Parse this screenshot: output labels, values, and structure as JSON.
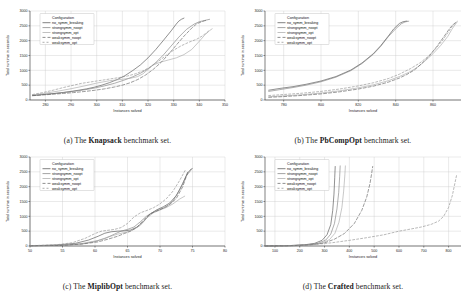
{
  "figure": {
    "background": "#ffffff",
    "axis_label_y": "Total runtime in seconds",
    "axis_label_x": "Instances solved",
    "legend_title": "Configuration",
    "series_names": [
      "no_symm_breaking",
      "strongsymm_noopt",
      "strongsymm_opt",
      "weaksymm_noopt",
      "weaksymm_opt"
    ],
    "series_colors": [
      "#4c4c4c",
      "#7d7d7d",
      "#a6a6a6",
      "#5f5f5f",
      "#8d8d8d"
    ],
    "series_dash": [
      "none",
      "none",
      "none",
      "3 2",
      "2 2"
    ]
  },
  "panels": [
    {
      "key": "a",
      "caption_prefix": "(a) The ",
      "caption_bold": "Knapsack",
      "caption_suffix": " benchmark set."
    },
    {
      "key": "b",
      "caption_prefix": "(b) The ",
      "caption_bold": "PbCompOpt",
      "caption_suffix": " benchmark set."
    },
    {
      "key": "c",
      "caption_prefix": "(c) The ",
      "caption_bold": "MiplibOpt",
      "caption_suffix": " benchmark set."
    },
    {
      "key": "d",
      "caption_prefix": "(d) The ",
      "caption_bold": "Crafted",
      "caption_suffix": " benchmark set."
    }
  ],
  "chart_data": [
    {
      "type": "line",
      "panel": "a",
      "title": "The Knapsack benchmark set.",
      "xlabel": "Instances solved",
      "ylabel": "Total runtime in seconds",
      "xlim": [
        274,
        350
      ],
      "ylim": [
        0,
        3000
      ],
      "xticks": [
        280,
        290,
        300,
        310,
        320,
        330,
        340,
        350
      ],
      "yticks": [
        0,
        500,
        1000,
        1500,
        2000,
        2500,
        3000
      ],
      "grid": true,
      "legend_position": "upper left",
      "series": [
        {
          "name": "no_symm_breaking",
          "x": [
            275,
            278,
            281,
            284,
            287,
            290,
            293,
            296,
            299,
            302,
            305,
            308,
            311,
            314,
            317,
            320,
            323,
            326,
            329,
            331,
            332,
            333,
            334
          ],
          "values": [
            150,
            175,
            200,
            225,
            255,
            290,
            330,
            375,
            430,
            500,
            585,
            690,
            820,
            990,
            1180,
            1420,
            1700,
            2010,
            2330,
            2560,
            2660,
            2720,
            2760
          ]
        },
        {
          "name": "strongsymm_noopt",
          "x": [
            275,
            279,
            283,
            287,
            291,
            295,
            299,
            303,
            307,
            311,
            314,
            317,
            320,
            323,
            326,
            329,
            332,
            335,
            338,
            340,
            342,
            343,
            344
          ],
          "values": [
            155,
            185,
            215,
            250,
            290,
            340,
            400,
            475,
            565,
            680,
            780,
            900,
            1050,
            1260,
            1520,
            1820,
            2120,
            2380,
            2560,
            2640,
            2680,
            2700,
            2720
          ]
        },
        {
          "name": "strongsymm_opt",
          "x": [
            275,
            280,
            285,
            290,
            295,
            300,
            305,
            310,
            313,
            316,
            318,
            320,
            322,
            325,
            328,
            331,
            334,
            337,
            340,
            342,
            344,
            345
          ],
          "values": [
            170,
            230,
            300,
            380,
            470,
            570,
            650,
            700,
            730,
            790,
            880,
            1030,
            1180,
            1280,
            1350,
            1420,
            1530,
            1700,
            1980,
            2180,
            2340,
            2400
          ]
        },
        {
          "name": "weaksymm_noopt",
          "x": [
            275,
            279,
            283,
            287,
            291,
            295,
            299,
            303,
            307,
            310,
            313,
            316,
            319,
            322,
            325,
            328,
            331,
            334,
            337,
            339,
            341,
            342,
            343
          ],
          "values": [
            145,
            170,
            195,
            220,
            250,
            285,
            325,
            375,
            440,
            500,
            580,
            690,
            840,
            1030,
            1260,
            1540,
            1850,
            2150,
            2420,
            2570,
            2640,
            2670,
            2690
          ]
        },
        {
          "name": "weaksymm_opt",
          "x": [
            275,
            279,
            283,
            287,
            291,
            294,
            297,
            300,
            303,
            306,
            309,
            312,
            315,
            318,
            321,
            324,
            327,
            330,
            333,
            336,
            339,
            341,
            343,
            344
          ],
          "values": [
            185,
            250,
            330,
            420,
            500,
            560,
            600,
            640,
            680,
            720,
            760,
            810,
            880,
            980,
            1120,
            1300,
            1500,
            1680,
            1830,
            1950,
            2050,
            2150,
            2280,
            2360
          ]
        }
      ]
    },
    {
      "type": "line",
      "panel": "b",
      "title": "The PbCompOpt benchmark set.",
      "xlabel": "Instances solved",
      "ylabel": "Total runtime in seconds",
      "xlim": [
        770,
        875
      ],
      "ylim": [
        0,
        3000
      ],
      "xticks": [
        780,
        800,
        820,
        840,
        860
      ],
      "yticks": [
        0,
        500,
        1000,
        1500,
        2000,
        2500,
        3000
      ],
      "grid": true,
      "legend_position": "upper left",
      "series": [
        {
          "name": "no_symm_breaking",
          "x": [
            772,
            778,
            785,
            792,
            800,
            808,
            816,
            822,
            828,
            832,
            836,
            839,
            842,
            844,
            845,
            846
          ],
          "values": [
            330,
            390,
            450,
            530,
            640,
            790,
            1010,
            1250,
            1560,
            1830,
            2150,
            2400,
            2580,
            2640,
            2650,
            2660
          ]
        },
        {
          "name": "strongsymm_noopt",
          "x": [
            772,
            778,
            785,
            792,
            800,
            808,
            816,
            822,
            828,
            832,
            836,
            840,
            843,
            845,
            846,
            847
          ],
          "values": [
            290,
            350,
            420,
            500,
            615,
            770,
            990,
            1230,
            1540,
            1810,
            2130,
            2400,
            2570,
            2630,
            2645,
            2655
          ]
        },
        {
          "name": "strongsymm_opt",
          "x": [
            772,
            780,
            790,
            800,
            810,
            820,
            828,
            836,
            842,
            848,
            852,
            856,
            860,
            864,
            868,
            870,
            872,
            873
          ],
          "values": [
            110,
            140,
            180,
            235,
            310,
            410,
            510,
            650,
            790,
            960,
            1120,
            1330,
            1560,
            1830,
            2150,
            2370,
            2560,
            2620
          ]
        },
        {
          "name": "weaksymm_noopt",
          "x": [
            772,
            780,
            790,
            800,
            810,
            820,
            828,
            836,
            842,
            846,
            850,
            854,
            858,
            862,
            866,
            869,
            871,
            873
          ],
          "values": [
            90,
            115,
            155,
            205,
            275,
            370,
            465,
            600,
            740,
            860,
            1010,
            1230,
            1480,
            1800,
            2150,
            2420,
            2560,
            2640
          ]
        },
        {
          "name": "weaksymm_opt",
          "x": [
            772,
            780,
            790,
            800,
            810,
            820,
            828,
            836,
            842,
            848,
            853,
            857,
            861,
            865,
            868,
            870,
            872,
            873
          ],
          "values": [
            150,
            185,
            230,
            290,
            370,
            475,
            580,
            720,
            870,
            1060,
            1250,
            1450,
            1700,
            2000,
            2270,
            2460,
            2600,
            2650
          ]
        }
      ]
    },
    {
      "type": "line",
      "panel": "c",
      "title": "The MiplibOpt benchmark set.",
      "xlabel": "Instances solved",
      "ylabel": "Total runtime in seconds",
      "xlim": [
        50,
        80
      ],
      "ylim": [
        0,
        3000
      ],
      "xticks": [
        50,
        55,
        60,
        65,
        70,
        75,
        80
      ],
      "yticks": [
        0,
        500,
        1000,
        1500,
        2000,
        2500,
        3000
      ],
      "grid": true,
      "legend_position": "upper left",
      "series": [
        {
          "name": "no_symm_breaking",
          "x": [
            50,
            54,
            57,
            59,
            60.5,
            61.5,
            62.5,
            63.5,
            64.5,
            65.5,
            66.5,
            67.5,
            68.5,
            69.5,
            70.5,
            71.5,
            72.5,
            73.5,
            74.2,
            74.8
          ],
          "values": [
            10,
            30,
            90,
            200,
            330,
            430,
            480,
            500,
            510,
            540,
            640,
            830,
            1080,
            1220,
            1320,
            1450,
            1700,
            2100,
            2450,
            2600
          ]
        },
        {
          "name": "strongsymm_noopt",
          "x": [
            50,
            55,
            58,
            60,
            61.5,
            63,
            64,
            65,
            66,
            67,
            68,
            69,
            70,
            71,
            72,
            73,
            74,
            75
          ],
          "values": [
            8,
            25,
            70,
            150,
            250,
            400,
            500,
            560,
            640,
            820,
            1020,
            1150,
            1230,
            1320,
            1520,
            1880,
            2350,
            2620
          ]
        },
        {
          "name": "strongsymm_opt",
          "x": [
            50,
            55,
            58,
            60.5,
            62,
            63.5,
            65,
            66,
            67,
            68,
            69,
            70,
            71,
            72,
            73,
            73.8
          ],
          "values": [
            10,
            30,
            85,
            190,
            300,
            400,
            480,
            560,
            700,
            950,
            1120,
            1210,
            1300,
            1420,
            1580,
            1680
          ]
        },
        {
          "name": "weaksymm_noopt",
          "x": [
            50,
            55,
            58,
            60.5,
            62,
            63.5,
            64.5,
            65.5,
            66.5,
            67.5,
            68.5,
            69.5,
            70.5,
            71.5,
            72.5,
            73.5,
            74.3
          ],
          "values": [
            8,
            22,
            65,
            140,
            230,
            330,
            420,
            500,
            640,
            880,
            1080,
            1180,
            1280,
            1400,
            1600,
            2000,
            2500
          ]
        },
        {
          "name": "weaksymm_opt",
          "x": [
            50,
            54,
            56.5,
            58.5,
            60,
            61,
            62,
            63,
            64,
            65,
            66,
            67,
            68,
            69,
            70,
            71,
            72,
            73,
            74
          ],
          "values": [
            12,
            40,
            110,
            260,
            420,
            500,
            530,
            560,
            620,
            760,
            980,
            1120,
            1200,
            1290,
            1420,
            1600,
            1850,
            2200,
            2600
          ]
        }
      ]
    },
    {
      "type": "line",
      "panel": "d",
      "title": "The Crafted benchmark set.",
      "xlabel": "Instances solved",
      "ylabel": "Total runtime in seconds",
      "xlim": [
        60,
        850
      ],
      "ylim": [
        0,
        3000
      ],
      "xticks": [
        100,
        200,
        300,
        400,
        500,
        600,
        700,
        800
      ],
      "yticks": [
        0,
        500,
        1000,
        1500,
        2000,
        2500,
        3000
      ],
      "grid": true,
      "legend_position": "upper left",
      "series": [
        {
          "name": "no_symm_breaking",
          "x": [
            60,
            150,
            220,
            260,
            290,
            310,
            325,
            333,
            338,
            341,
            343
          ],
          "values": [
            2,
            10,
            40,
            90,
            190,
            380,
            720,
            1200,
            1750,
            2300,
            2680
          ]
        },
        {
          "name": "strongsymm_noopt",
          "x": [
            60,
            150,
            230,
            275,
            305,
            325,
            340,
            350,
            357,
            361,
            363
          ],
          "values": [
            2,
            10,
            40,
            95,
            200,
            400,
            760,
            1250,
            1800,
            2350,
            2700
          ]
        },
        {
          "name": "strongsymm_opt",
          "x": [
            60,
            160,
            240,
            290,
            320,
            342,
            358,
            370,
            377,
            382,
            384
          ],
          "values": [
            2,
            10,
            42,
            100,
            215,
            430,
            800,
            1300,
            1850,
            2400,
            2700
          ]
        },
        {
          "name": "weaksymm_noopt",
          "x": [
            60,
            170,
            250,
            300,
            340,
            380,
            420,
            450,
            470,
            483,
            490,
            494
          ],
          "values": [
            2,
            10,
            45,
            105,
            230,
            420,
            760,
            1200,
            1650,
            2100,
            2450,
            2680
          ]
        },
        {
          "name": "weaksymm_opt",
          "x": [
            60,
            180,
            260,
            330,
            400,
            470,
            540,
            580,
            600,
            640,
            690,
            730,
            760,
            780,
            800,
            815,
            825,
            832
          ],
          "values": [
            2,
            12,
            50,
            110,
            190,
            280,
            380,
            460,
            500,
            560,
            640,
            730,
            840,
            1000,
            1300,
            1700,
            2100,
            2380
          ]
        }
      ]
    }
  ]
}
